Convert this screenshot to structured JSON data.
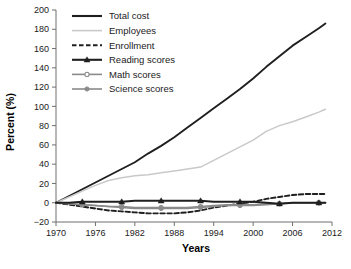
{
  "chart_data": {
    "type": "line",
    "title": "",
    "xlabel": "Years",
    "ylabel": "Percent (%)",
    "xlim": [
      1970,
      2012
    ],
    "ylim": [
      -20,
      200
    ],
    "xticks": [
      "1970",
      "1976",
      "1982",
      "1988",
      "1994",
      "2000",
      "2006",
      "2012"
    ],
    "yticks": [
      "-20",
      "0",
      "20",
      "40",
      "60",
      "80",
      "100",
      "120",
      "140",
      "160",
      "180",
      "200"
    ],
    "grid": false,
    "legend_position": "top-center",
    "x": [
      1970,
      1972,
      1974,
      1976,
      1978,
      1980,
      1982,
      1984,
      1986,
      1988,
      1990,
      1992,
      1994,
      1996,
      1998,
      2000,
      2002,
      2004,
      2006,
      2008,
      2010,
      2011
    ],
    "series": [
      {
        "name": "Total cost",
        "color": "#1f1f1f",
        "style": "solid",
        "marker": "none",
        "values": [
          0,
          7,
          14,
          21,
          28,
          35,
          42,
          51,
          59,
          68,
          78,
          88,
          98,
          108,
          118,
          129,
          141,
          152,
          163,
          172,
          181,
          186
        ]
      },
      {
        "name": "Employees",
        "color": "#c9c9c9",
        "style": "solid",
        "marker": "none",
        "values": [
          0,
          6,
          12,
          18,
          23,
          26,
          28,
          29,
          31,
          33,
          35,
          37,
          44,
          51,
          58,
          65,
          74,
          80,
          84,
          89,
          94,
          97
        ]
      },
      {
        "name": "Enrollment",
        "color": "#1f1f1f",
        "style": "dashed",
        "marker": "none",
        "values": [
          0,
          -2,
          -4,
          -6,
          -8,
          -9,
          -10,
          -11,
          -11,
          -11,
          -10,
          -8,
          -5,
          -3,
          -1,
          1,
          4,
          6,
          8,
          9,
          9,
          9
        ]
      },
      {
        "name": "Reading scores",
        "color": "#1f1f1f",
        "style": "solid",
        "marker": "triangle",
        "values": [
          0,
          0,
          1,
          1,
          1,
          1,
          2,
          2,
          2,
          2,
          2,
          2,
          1,
          1,
          1,
          1,
          0,
          -1,
          0,
          0,
          0,
          0
        ]
      },
      {
        "name": "Math scores",
        "color": "#8a8a8a",
        "style": "solid",
        "marker": "circle-open",
        "values": [
          0,
          -1,
          -2,
          -3,
          -4,
          -4,
          -5,
          -5,
          -5,
          -5,
          -5,
          -4,
          -3,
          -2,
          -2,
          -2,
          -1,
          -1,
          0,
          0,
          0,
          0
        ]
      },
      {
        "name": "Science scores",
        "color": "#8a8a8a",
        "style": "solid",
        "marker": "circle-filled",
        "values": [
          0,
          -1,
          -2,
          -3,
          -4,
          -5,
          -6,
          -6,
          -6,
          -6,
          -6,
          -5,
          -4,
          -3,
          -3,
          -3,
          -2,
          -1,
          0,
          0,
          0,
          0
        ]
      }
    ]
  },
  "legend": {
    "items": [
      {
        "label": "Total cost"
      },
      {
        "label": "Employees"
      },
      {
        "label": "Enrollment"
      },
      {
        "label": "Reading scores"
      },
      {
        "label": "Math scores"
      },
      {
        "label": "Science scores"
      }
    ]
  }
}
